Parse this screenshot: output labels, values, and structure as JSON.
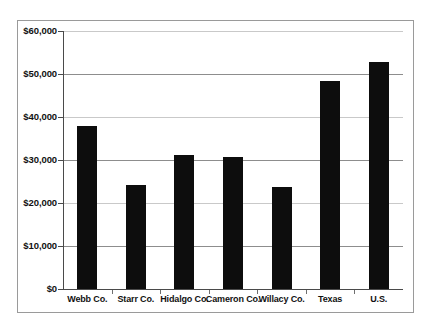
{
  "chart_data": {
    "type": "bar",
    "title": "",
    "xlabel": "",
    "ylabel": "",
    "categories": [
      "Webb Co.",
      "Starr Co.",
      "Hidalgo Co.",
      "Cameron Co.",
      "Willacy Co.",
      "Texas",
      "U.S."
    ],
    "values": [
      38000,
      24200,
      31100,
      30600,
      23800,
      48300,
      52700
    ],
    "ylim": [
      0,
      60000
    ],
    "ytick_values": [
      0,
      10000,
      20000,
      30000,
      40000,
      50000,
      60000
    ],
    "ytick_labels": [
      "$0",
      "$10,000",
      "$20,000",
      "$30,000",
      "$40,000",
      "$50,000",
      "$60,000"
    ],
    "grid": true,
    "legend": false,
    "series": [
      {
        "name": "Median household income",
        "color": "#0d0d0d",
        "values": [
          38000,
          24200,
          31100,
          30600,
          23800,
          48300,
          52700
        ]
      }
    ]
  },
  "colors": {
    "bar": "#0d0d0d",
    "gridline": "#8d8d8d",
    "axis": "#4a4a4a",
    "frame": "#9a9a9a",
    "background": "#ffffff",
    "text": "#111111"
  }
}
